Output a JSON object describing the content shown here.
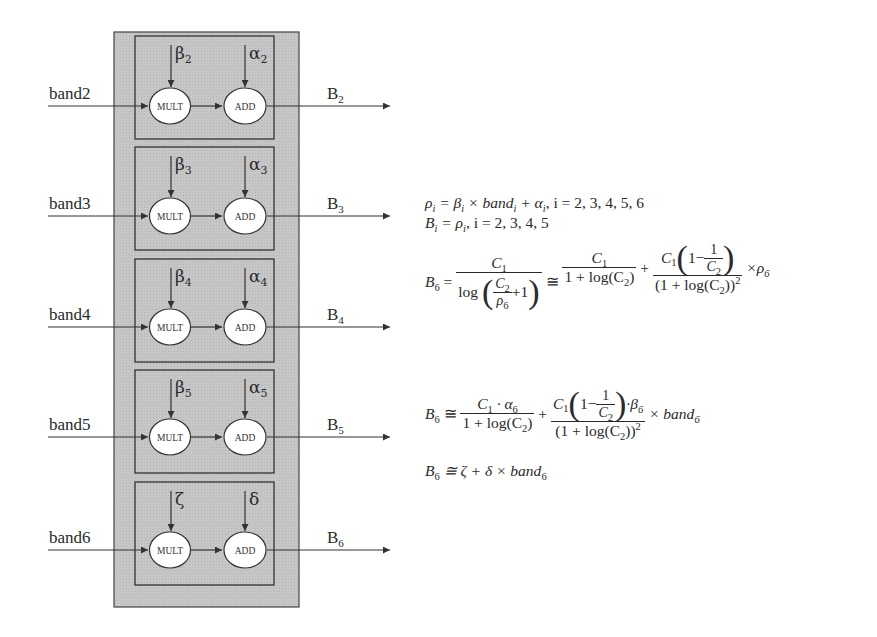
{
  "diagram": {
    "rows": [
      {
        "input": "band2",
        "mult_param": "β",
        "mult_sub": "2",
        "add_param": "α",
        "add_sub": "2",
        "output": "B",
        "output_sub": "2",
        "mult_label": "MULT",
        "add_label": "ADD"
      },
      {
        "input": "band3",
        "mult_param": "β",
        "mult_sub": "3",
        "add_param": "α",
        "add_sub": "3",
        "output": "B",
        "output_sub": "3",
        "mult_label": "MULT",
        "add_label": "ADD"
      },
      {
        "input": "band4",
        "mult_param": "β",
        "mult_sub": "4",
        "add_param": "α",
        "add_sub": "4",
        "output": "B",
        "output_sub": "4",
        "mult_label": "MULT",
        "add_label": "ADD"
      },
      {
        "input": "band5",
        "mult_param": "β",
        "mult_sub": "5",
        "add_param": "α",
        "add_sub": "5",
        "output": "B",
        "output_sub": "5",
        "mult_label": "MULT",
        "add_label": "ADD"
      },
      {
        "input": "band6",
        "mult_param": "ζ",
        "mult_sub": "",
        "add_param": "δ",
        "add_sub": "",
        "output": "B",
        "output_sub": "6",
        "mult_label": "MULT",
        "add_label": "ADD"
      }
    ],
    "colors": {
      "outer_fill": "#c8c8c8",
      "inner_fill": "#cfcfcf",
      "stroke": "#333333",
      "node_fill": "#ffffff"
    }
  },
  "equations": {
    "eq1": {
      "lhs": "ρ",
      "lhs_sub": "i",
      "rhs": "= β",
      "rhs_sub": "i",
      "mid": " × band",
      "mid_sub": "i",
      "plus": " + α",
      "plus_sub": "i",
      "cond": ", i = 2, 3, 4, 5, 6"
    },
    "eq2": {
      "lhs": "B",
      "lhs_sub": "i",
      "eq": " = ρ",
      "eq_sub": "i",
      "cond": ", i = 2, 3, 4, 5"
    },
    "eq3": {
      "lhs": "B",
      "lhs_sub": "6",
      "eq": "=",
      "f1_num": "C",
      "f1_num_sub": "1",
      "f1_den_log": "log",
      "f1_inner_num": "C",
      "f1_inner_num_sub": "2",
      "f1_inner_den": "ρ",
      "f1_inner_den_sub": "6",
      "f1_plus_one": "+1",
      "approx": "≅",
      "f2_num": "C",
      "f2_num_sub": "1",
      "f2_den": "1 + log(C",
      "f2_den_sub": "2",
      "f2_den_close": ")",
      "plus": "+",
      "f3_num_c": "C",
      "f3_num_c_sub": "1",
      "f3_num_one": "1−",
      "f3_num_frac_num": "1",
      "f3_num_frac_den": "C",
      "f3_num_frac_den_sub": "2",
      "f3_den": "(1 + log(C",
      "f3_den_sub": "2",
      "f3_den_close": "))",
      "f3_den_sup": "2",
      "times": "×ρ",
      "times_sub": "6"
    },
    "eq4": {
      "lhs": "B",
      "lhs_sub": "6",
      "approx": "≅",
      "f1_num": "C",
      "f1_num_sub": "1",
      "f1_num_rest": " · α",
      "f1_num_rest_sub": "6",
      "f1_den": "1 + log(C",
      "f1_den_sub": "2",
      "f1_den_close": ")",
      "plus": "+",
      "f2_num_c": "C",
      "f2_num_c_sub": "1",
      "f2_num_one": "1−",
      "f2_frac_num": "1",
      "f2_frac_den": "C",
      "f2_frac_den_sub": "2",
      "f2_num_tail": "·β",
      "f2_num_tail_sub": "6",
      "f2_den": "(1 + log(C",
      "f2_den_sub": "2",
      "f2_den_close": "))",
      "f2_den_sup": "2",
      "times": "× band",
      "times_sub": "6"
    },
    "eq5": {
      "lhs": "B",
      "lhs_sub": "6",
      "rhs": "≅ ζ + δ × band",
      "rhs_sub": "6"
    }
  }
}
